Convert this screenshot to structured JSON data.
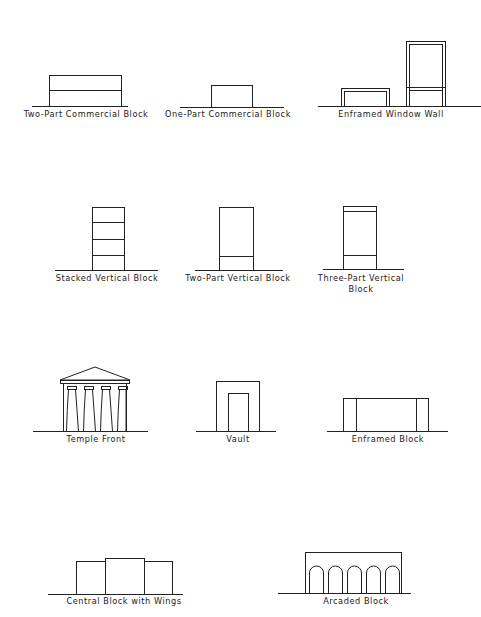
{
  "diagrams": [
    {
      "id": "two-part-commercial",
      "label": "Two-Part Commercial Block"
    },
    {
      "id": "one-part-commercial",
      "label": "One-Part Commercial Block"
    },
    {
      "id": "enframed-window-wall",
      "label": "Enframed Window Wall"
    },
    {
      "id": "stacked-vertical",
      "label": "Stacked Vertical Block"
    },
    {
      "id": "two-part-vertical",
      "label": "Two-Part Vertical Block"
    },
    {
      "id": "three-part-vertical",
      "label": "Three-Part Vertical",
      "label_line2": "Block"
    },
    {
      "id": "temple-front",
      "label": "Temple Front"
    },
    {
      "id": "vault",
      "label": "Vault"
    },
    {
      "id": "enframed-block",
      "label": "Enframed Block"
    },
    {
      "id": "central-block-wings",
      "label": "Central Block with Wings"
    },
    {
      "id": "arcaded-block",
      "label": "Arcaded Block"
    }
  ],
  "colors": {
    "line": "#222222",
    "text": "#1a1a1a",
    "background": "#ffffff"
  }
}
